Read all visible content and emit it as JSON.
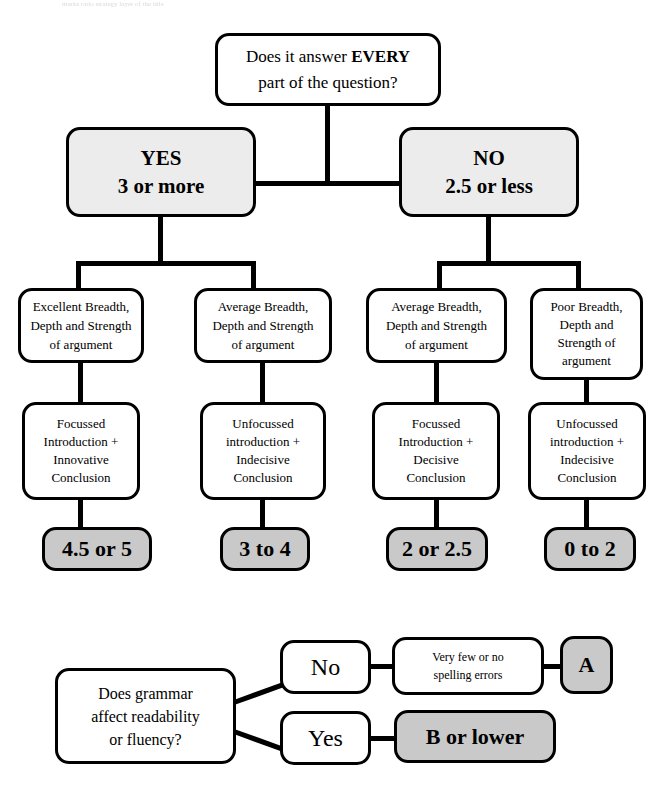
{
  "page": {
    "scan_remnant": "marks ratio strategy layer of the title"
  },
  "top_chart": {
    "question": {
      "line1_pre": "Does it answer ",
      "line1_strong": "EVERY",
      "line2": "part of the question?"
    },
    "branches": [
      {
        "label": "YES",
        "value": "3 or more"
      },
      {
        "label": "NO",
        "value": "2.5 or less"
      }
    ],
    "criteria": [
      {
        "lines": [
          "Excellent Breadth,",
          "Depth and Strength",
          "of argument"
        ]
      },
      {
        "lines": [
          "Average Breadth,",
          "Depth and Strength",
          "of argument"
        ]
      },
      {
        "lines": [
          "Average Breadth,",
          "Depth and Strength",
          "of argument"
        ]
      },
      {
        "lines": [
          "Poor Breadth,",
          "Depth and",
          "Strength of",
          "argument"
        ]
      }
    ],
    "conclusions": [
      {
        "lines": [
          "Focussed",
          "Introduction +",
          "Innovative",
          "Conclusion"
        ]
      },
      {
        "lines": [
          "Unfocussed",
          "introduction +",
          "Indecisive",
          "Conclusion"
        ]
      },
      {
        "lines": [
          "Focussed",
          "Introduction +",
          "Decisive",
          "Conclusion"
        ]
      },
      {
        "lines": [
          "Unfocussed",
          "introduction +",
          "Indecisive",
          "Conclusion"
        ]
      }
    ],
    "grades": [
      {
        "label": "4.5 or 5"
      },
      {
        "label": "3 to 4"
      },
      {
        "label": "2 or 2.5"
      },
      {
        "label": "0 to 2"
      }
    ]
  },
  "bottom_chart": {
    "question": {
      "lines": [
        "Does grammar",
        "affect readability",
        "or fluency?"
      ]
    },
    "no_label": "No",
    "yes_label": "Yes",
    "spelling": {
      "lines": [
        "Very few or no",
        "spelling errors"
      ]
    },
    "grade_a": "A",
    "grade_b": "B or lower"
  },
  "colors": {
    "outline": "#000000",
    "light_fill": "#ececec",
    "gray_fill": "#c9c9c9",
    "background": "#ffffff"
  }
}
